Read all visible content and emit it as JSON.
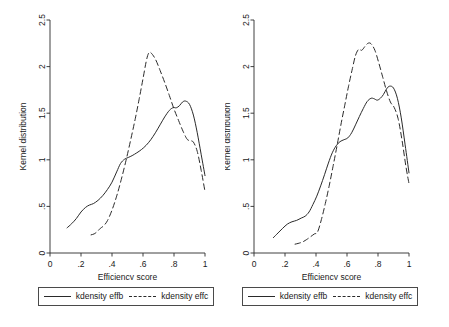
{
  "figure": {
    "width": 449,
    "height": 327,
    "background": "#ffffff",
    "line_color": "#2a2a2a"
  },
  "chart_data": [
    {
      "type": "line",
      "panel": "left",
      "title": "",
      "xlabel": "Efficiency score",
      "ylabel": "Kernel distribution",
      "xlim": [
        0,
        1
      ],
      "ylim": [
        0,
        2.5
      ],
      "xticks": [
        0,
        0.2,
        0.4,
        0.6,
        0.8,
        1
      ],
      "xticklabels": [
        "0",
        ".2",
        ".4",
        ".6",
        ".8",
        "1"
      ],
      "yticks": [
        0,
        0.5,
        1,
        1.5,
        2,
        2.5
      ],
      "yticklabels": [
        "0",
        ".5",
        "1",
        "1.5",
        "2",
        "2.5"
      ],
      "grid": false,
      "legend_position": "below",
      "series": [
        {
          "name": "kdensity effb",
          "style": "solid",
          "x": [
            0.11,
            0.14,
            0.17,
            0.2,
            0.23,
            0.255,
            0.28,
            0.31,
            0.34,
            0.37,
            0.4,
            0.43,
            0.455,
            0.48,
            0.505,
            0.53,
            0.56,
            0.59,
            0.62,
            0.65,
            0.68,
            0.71,
            0.74,
            0.77,
            0.795,
            0.815,
            0.835,
            0.855,
            0.875,
            0.9,
            0.925,
            0.95,
            0.975,
            1.0
          ],
          "y": [
            0.27,
            0.315,
            0.37,
            0.44,
            0.49,
            0.515,
            0.53,
            0.565,
            0.615,
            0.68,
            0.76,
            0.87,
            0.96,
            1.005,
            1.025,
            1.045,
            1.075,
            1.11,
            1.155,
            1.215,
            1.29,
            1.375,
            1.46,
            1.53,
            1.56,
            1.558,
            1.58,
            1.62,
            1.63,
            1.595,
            1.48,
            1.29,
            1.06,
            0.83
          ]
        },
        {
          "name": "kdensity effc",
          "style": "dashed",
          "x": [
            0.265,
            0.285,
            0.305,
            0.325,
            0.345,
            0.37,
            0.4,
            0.43,
            0.46,
            0.49,
            0.52,
            0.55,
            0.575,
            0.6,
            0.62,
            0.635,
            0.65,
            0.68,
            0.71,
            0.74,
            0.77,
            0.8,
            0.83,
            0.86,
            0.885,
            0.905,
            0.925,
            0.95,
            0.975,
            1.0
          ],
          "y": [
            0.195,
            0.205,
            0.23,
            0.265,
            0.29,
            0.345,
            0.46,
            0.61,
            0.79,
            0.99,
            1.21,
            1.44,
            1.65,
            1.87,
            2.05,
            2.14,
            2.15,
            2.08,
            1.96,
            1.83,
            1.69,
            1.545,
            1.42,
            1.3,
            1.22,
            1.205,
            1.19,
            1.09,
            0.89,
            0.66
          ]
        }
      ]
    },
    {
      "type": "line",
      "panel": "right",
      "title": "",
      "xlabel": "Efficiency score",
      "ylabel": "Kernel distribution",
      "xlim": [
        0,
        1
      ],
      "ylim": [
        0,
        2.5
      ],
      "xticks": [
        0,
        0.2,
        0.4,
        0.6,
        0.8,
        1
      ],
      "xticklabels": [
        "0",
        ".2",
        ".4",
        ".6",
        ".8",
        "1"
      ],
      "yticks": [
        0,
        0.5,
        1,
        1.5,
        2,
        2.5
      ],
      "yticklabels": [
        "0",
        ".5",
        "1",
        "1.5",
        "2",
        "2.5"
      ],
      "grid": false,
      "legend_position": "below",
      "series": [
        {
          "name": "kdensity effb",
          "style": "solid",
          "x": [
            0.125,
            0.155,
            0.185,
            0.215,
            0.245,
            0.275,
            0.305,
            0.33,
            0.355,
            0.38,
            0.405,
            0.43,
            0.455,
            0.48,
            0.505,
            0.53,
            0.555,
            0.58,
            0.605,
            0.63,
            0.655,
            0.68,
            0.705,
            0.73,
            0.755,
            0.775,
            0.795,
            0.815,
            0.835,
            0.855,
            0.875,
            0.9,
            0.925,
            0.95,
            0.975,
            1.0
          ],
          "y": [
            0.165,
            0.215,
            0.265,
            0.31,
            0.335,
            0.35,
            0.375,
            0.395,
            0.44,
            0.52,
            0.61,
            0.72,
            0.84,
            0.965,
            1.075,
            1.15,
            1.195,
            1.215,
            1.235,
            1.29,
            1.375,
            1.465,
            1.55,
            1.625,
            1.66,
            1.655,
            1.64,
            1.66,
            1.7,
            1.76,
            1.79,
            1.77,
            1.66,
            1.45,
            1.16,
            0.86
          ]
        },
        {
          "name": "kdensity effc",
          "style": "dashed",
          "x": [
            0.265,
            0.29,
            0.315,
            0.34,
            0.365,
            0.39,
            0.41,
            0.435,
            0.46,
            0.485,
            0.51,
            0.535,
            0.56,
            0.585,
            0.61,
            0.635,
            0.655,
            0.675,
            0.695,
            0.715,
            0.735,
            0.755,
            0.78,
            0.805,
            0.83,
            0.855,
            0.88,
            0.905,
            0.93,
            0.955,
            0.98,
            1.0
          ],
          "y": [
            0.095,
            0.105,
            0.12,
            0.145,
            0.175,
            0.205,
            0.225,
            0.36,
            0.53,
            0.72,
            0.93,
            1.145,
            1.37,
            1.58,
            1.79,
            1.98,
            2.12,
            2.185,
            2.175,
            2.215,
            2.25,
            2.245,
            2.175,
            2.04,
            1.89,
            1.74,
            1.62,
            1.56,
            1.44,
            1.21,
            0.93,
            0.745
          ]
        }
      ]
    }
  ],
  "panels": [
    {
      "id": "left",
      "xlabel": "Efficiency score",
      "ylabel": "Kernel distribution",
      "legend": {
        "entries": [
          {
            "label": "kdensity effb",
            "style": "solid"
          },
          {
            "label": "kdensity effc",
            "style": "dashed"
          }
        ]
      }
    },
    {
      "id": "right",
      "xlabel": "Efficiency score",
      "ylabel": "Kernel distribution",
      "legend": {
        "entries": [
          {
            "label": "kdensity effb",
            "style": "solid"
          },
          {
            "label": "kdensity effc",
            "style": "dashed"
          }
        ]
      }
    }
  ]
}
